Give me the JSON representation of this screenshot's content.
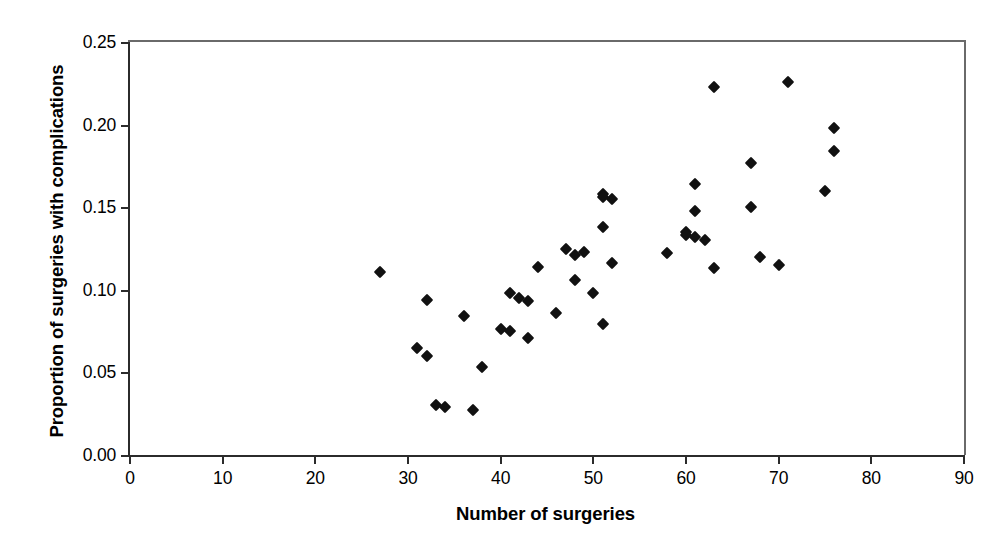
{
  "chart_data": {
    "type": "scatter",
    "title": "",
    "xlabel": "Number of surgeries",
    "ylabel": "Proportion of surgeries with complications",
    "xlim": [
      0,
      90
    ],
    "ylim": [
      0.0,
      0.25
    ],
    "xticks": [
      "0",
      "10",
      "20",
      "30",
      "40",
      "50",
      "60",
      "70",
      "80",
      "90"
    ],
    "xtick_values": [
      0,
      10,
      20,
      30,
      40,
      50,
      60,
      70,
      80,
      90
    ],
    "yticks": [
      "0.00",
      "0.05",
      "0.10",
      "0.15",
      "0.20",
      "0.25"
    ],
    "ytick_values": [
      0.0,
      0.05,
      0.1,
      0.15,
      0.2,
      0.25
    ],
    "grid": false,
    "legend": false,
    "marker": "diamond",
    "marker_color": "#111111",
    "axis_color": "#2b2b2b",
    "points": [
      {
        "x": 27,
        "y": 0.111
      },
      {
        "x": 31,
        "y": 0.065
      },
      {
        "x": 32,
        "y": 0.094
      },
      {
        "x": 32,
        "y": 0.06
      },
      {
        "x": 33,
        "y": 0.03
      },
      {
        "x": 34,
        "y": 0.029
      },
      {
        "x": 36,
        "y": 0.084
      },
      {
        "x": 37,
        "y": 0.027
      },
      {
        "x": 38,
        "y": 0.053
      },
      {
        "x": 40,
        "y": 0.076
      },
      {
        "x": 41,
        "y": 0.098
      },
      {
        "x": 41,
        "y": 0.075
      },
      {
        "x": 42,
        "y": 0.095
      },
      {
        "x": 43,
        "y": 0.093
      },
      {
        "x": 43,
        "y": 0.071
      },
      {
        "x": 44,
        "y": 0.114
      },
      {
        "x": 46,
        "y": 0.086
      },
      {
        "x": 47,
        "y": 0.125
      },
      {
        "x": 48,
        "y": 0.106
      },
      {
        "x": 48,
        "y": 0.121
      },
      {
        "x": 49,
        "y": 0.123
      },
      {
        "x": 50,
        "y": 0.098
      },
      {
        "x": 51,
        "y": 0.158
      },
      {
        "x": 51,
        "y": 0.156
      },
      {
        "x": 51,
        "y": 0.138
      },
      {
        "x": 51,
        "y": 0.079
      },
      {
        "x": 52,
        "y": 0.155
      },
      {
        "x": 52,
        "y": 0.116
      },
      {
        "x": 58,
        "y": 0.122
      },
      {
        "x": 60,
        "y": 0.135
      },
      {
        "x": 60,
        "y": 0.133
      },
      {
        "x": 61,
        "y": 0.164
      },
      {
        "x": 61,
        "y": 0.148
      },
      {
        "x": 61,
        "y": 0.132
      },
      {
        "x": 62,
        "y": 0.13
      },
      {
        "x": 63,
        "y": 0.223
      },
      {
        "x": 63,
        "y": 0.113
      },
      {
        "x": 67,
        "y": 0.177
      },
      {
        "x": 67,
        "y": 0.15
      },
      {
        "x": 68,
        "y": 0.12
      },
      {
        "x": 70,
        "y": 0.115
      },
      {
        "x": 71,
        "y": 0.226
      },
      {
        "x": 75,
        "y": 0.16
      },
      {
        "x": 76,
        "y": 0.198
      },
      {
        "x": 76,
        "y": 0.184
      }
    ]
  }
}
